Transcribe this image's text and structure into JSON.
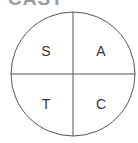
{
  "diagram": {
    "title": "CAST",
    "quadrants": {
      "top_left": "S",
      "top_right": "A",
      "bottom_left": "T",
      "bottom_right": "C"
    },
    "colors": {
      "line": "#555555",
      "text": "#333333",
      "title": "#9a9a9a"
    }
  }
}
